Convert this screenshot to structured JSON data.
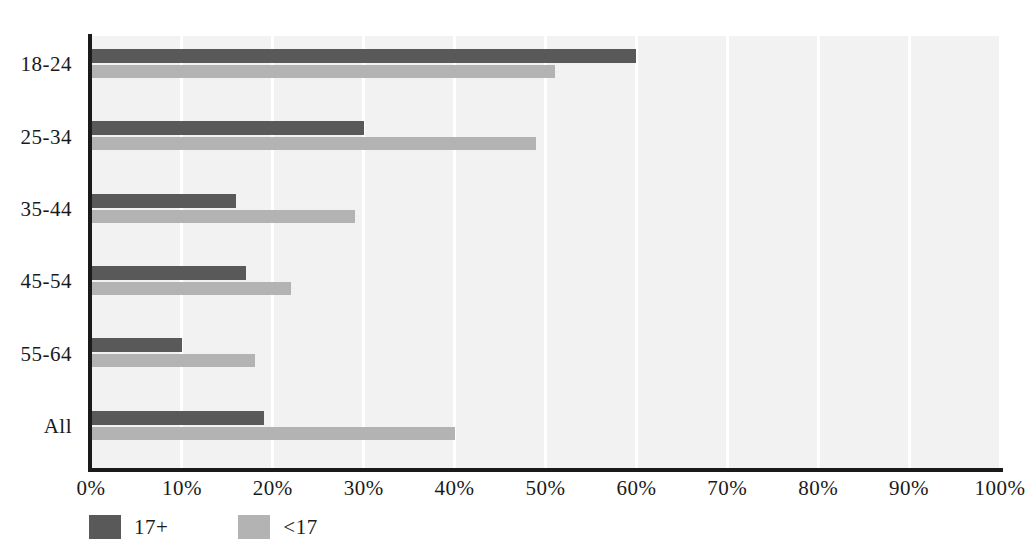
{
  "chart_data": {
    "type": "bar",
    "orientation": "horizontal",
    "title": "",
    "subtitle": "",
    "xlabel": "",
    "ylabel": "",
    "categories": [
      "18-24",
      "25-34",
      "35-44",
      "45-54",
      "55-64",
      "All"
    ],
    "series": [
      {
        "name": "17+",
        "color": "#595959",
        "values": [
          60,
          30,
          16,
          17,
          10,
          19
        ]
      },
      {
        "name": "<17",
        "color": "#b3b3b3",
        "values": [
          51,
          49,
          29,
          22,
          18,
          40
        ]
      }
    ],
    "xlim": [
      0,
      100
    ],
    "xticks": [
      0,
      10,
      20,
      30,
      40,
      50,
      60,
      70,
      80,
      90,
      100
    ],
    "xtick_labels": [
      "0%",
      "10%",
      "20%",
      "30%",
      "40%",
      "50%",
      "60%",
      "70%",
      "80%",
      "90%",
      "100%"
    ],
    "grid": true,
    "grid_axis": "x",
    "grid_color": "#ffffff",
    "plot_background": "#f2f2f2",
    "axis_color": "#1a1a1a",
    "legend_position": "bottom-left",
    "value_labels": false
  },
  "legend": {
    "items": [
      {
        "label": "17+",
        "color": "#595959"
      },
      {
        "label": "<17",
        "color": "#b3b3b3"
      }
    ]
  }
}
